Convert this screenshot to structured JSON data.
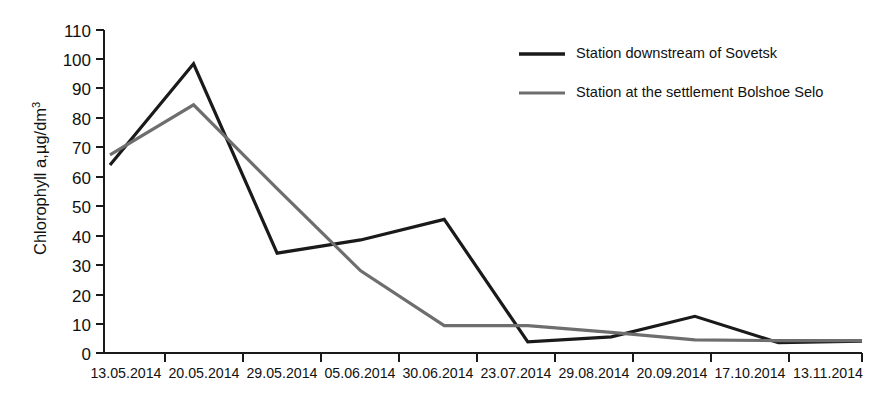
{
  "chart_data": {
    "type": "line",
    "title": "",
    "xlabel": "",
    "ylabel": "Chlorophyll a,µg/dm",
    "ylabel_superscript": "3",
    "categories": [
      "13.05.2014",
      "20.05.2014",
      "29.05.2014",
      "05.06.2014",
      "30.06.2014",
      "23.07.2014",
      "29.08.2014",
      "20.09.2014",
      "17.10.2014",
      "13.11.2014"
    ],
    "ylim": [
      0,
      110
    ],
    "yticks": [
      0,
      10,
      20,
      30,
      40,
      50,
      60,
      70,
      80,
      90,
      100,
      110
    ],
    "grid": false,
    "legend_position": "top-right",
    "series": [
      {
        "name": "Station downstream of Sovetsk",
        "color": "#1a1a1a",
        "width": 3.2,
        "values": [
          64,
          98.5,
          34,
          38.5,
          45.5,
          3.8,
          5.5,
          12.5,
          3.5,
          4
        ]
      },
      {
        "name": "Station at the settlement Bolshoe Selo",
        "color": "#6e6e6e",
        "width": 3.2,
        "values": [
          67.5,
          84.5,
          56,
          28,
          9.3,
          9.3,
          7,
          4.5,
          4.2,
          4.2
        ]
      }
    ]
  },
  "legend": {
    "items": [
      {
        "label": "Station downstream of Sovetsk",
        "color": "#1a1a1a"
      },
      {
        "label": "Station at the settlement Bolshoe Selo",
        "color": "#6e6e6e"
      }
    ]
  },
  "axis": {
    "y_tick_labels": [
      "110",
      "100",
      "90",
      "80",
      "70",
      "60",
      "50",
      "40",
      "30",
      "20",
      "10",
      "0"
    ],
    "x_tick_labels": [
      "13.05.2014",
      "20.05.2014",
      "29.05.2014",
      "05.06.2014",
      "30.06.2014",
      "23.07.2014",
      "29.08.2014",
      "20.09.2014",
      "17.10.2014",
      "13.11.2014"
    ]
  }
}
